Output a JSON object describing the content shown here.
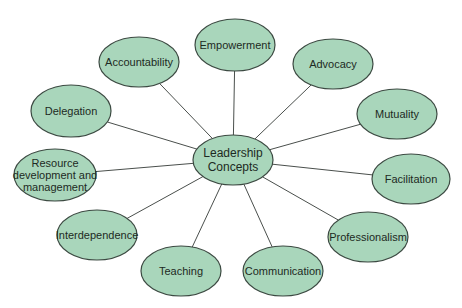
{
  "diagram": {
    "type": "concept-map",
    "colors": {
      "node_fill": "#a9d6bb",
      "node_stroke": "#3c4a42",
      "edge": "#4a4f4c",
      "text": "#1d2a23"
    },
    "center": {
      "id": "leadership-concepts",
      "lines": [
        "Leadership",
        "Concepts"
      ],
      "cx": 233,
      "cy": 160,
      "rx": 40,
      "ry": 25
    },
    "nodes": [
      {
        "id": "empowerment",
        "lines": [
          "Empowerment"
        ],
        "cx": 235,
        "cy": 45,
        "rx": 40,
        "ry": 26
      },
      {
        "id": "accountability",
        "lines": [
          "Accountability"
        ],
        "cx": 139,
        "cy": 62,
        "rx": 40,
        "ry": 25
      },
      {
        "id": "advocacy",
        "lines": [
          "Advocacy"
        ],
        "cx": 333,
        "cy": 64,
        "rx": 40,
        "ry": 25
      },
      {
        "id": "delegation",
        "lines": [
          "Delegation"
        ],
        "cx": 71,
        "cy": 111,
        "rx": 40,
        "ry": 26
      },
      {
        "id": "mutuality",
        "lines": [
          "Mutuality"
        ],
        "cx": 397,
        "cy": 114,
        "rx": 40,
        "ry": 25
      },
      {
        "id": "resource-development",
        "lines": [
          "Resource",
          "development and",
          "management"
        ],
        "cx": 55,
        "cy": 175,
        "rx": 41,
        "ry": 26
      },
      {
        "id": "facilitation",
        "lines": [
          "Facilitation"
        ],
        "cx": 411,
        "cy": 179,
        "rx": 39,
        "ry": 25
      },
      {
        "id": "interdependence",
        "lines": [
          "Interdependence"
        ],
        "cx": 97,
        "cy": 235,
        "rx": 40,
        "ry": 25
      },
      {
        "id": "professionalism",
        "lines": [
          "Professionalism"
        ],
        "cx": 368,
        "cy": 237,
        "rx": 40,
        "ry": 25
      },
      {
        "id": "teaching",
        "lines": [
          "Teaching"
        ],
        "cx": 181,
        "cy": 271,
        "rx": 40,
        "ry": 25
      },
      {
        "id": "communication",
        "lines": [
          "Communication"
        ],
        "cx": 283,
        "cy": 271,
        "rx": 40,
        "ry": 25
      }
    ]
  }
}
